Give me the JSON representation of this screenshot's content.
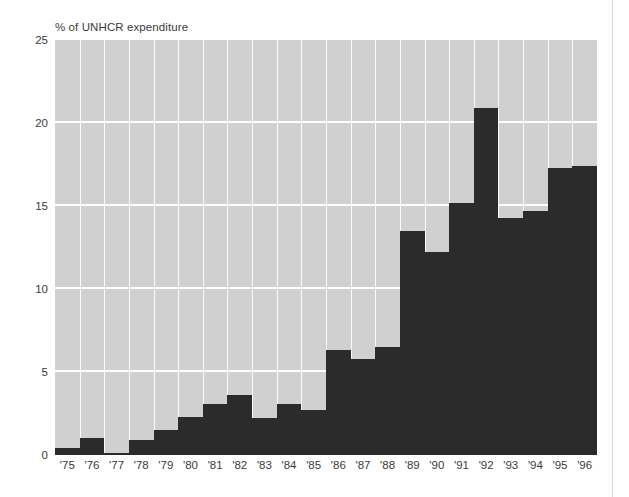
{
  "figure": {
    "title": "% of UNHCR expenditure",
    "background_color": "#ffffff",
    "plot_background_color": "#d0d0d0",
    "bar_color": "#2b2b2b",
    "grid_color": "#ffffff",
    "text_color": "#3b3b3b"
  },
  "axes": {
    "y_ticks": [
      "25",
      "20",
      "15",
      "10",
      "5",
      "0"
    ],
    "y_tick_values": [
      25,
      20,
      15,
      10,
      5,
      0
    ],
    "x_ticks": [
      "'75",
      "'76",
      "'77",
      "'78",
      "'79",
      "'80",
      "'81",
      "'82",
      "'83",
      "'84",
      "'85",
      "'86",
      "'87",
      "'88",
      "'89",
      "'90",
      "'91",
      "'92",
      "'93",
      "'94",
      "'95",
      "'96"
    ]
  },
  "chart_data": {
    "type": "bar",
    "title": "% of UNHCR expenditure",
    "xlabel": "",
    "ylabel": "% of UNHCR expenditure",
    "ylim": [
      0,
      25
    ],
    "yticks": [
      0,
      5,
      10,
      15,
      20,
      25
    ],
    "grid": true,
    "legend": false,
    "categories": [
      "'75",
      "'76",
      "'77",
      "'78",
      "'79",
      "'80",
      "'81",
      "'82",
      "'83",
      "'84",
      "'85",
      "'86",
      "'87",
      "'88",
      "'89",
      "'90",
      "'91",
      "'92",
      "'93",
      "'94",
      "'95",
      "'96"
    ],
    "values": [
      0.4,
      1.0,
      0.1,
      0.9,
      1.5,
      2.3,
      3.1,
      3.6,
      2.2,
      3.1,
      2.7,
      6.3,
      5.8,
      6.5,
      13.5,
      12.2,
      15.2,
      20.9,
      14.3,
      14.7,
      17.3,
      17.4
    ],
    "series": [
      {
        "name": "% of UNHCR expenditure",
        "values": [
          0.4,
          1.0,
          0.1,
          0.9,
          1.5,
          2.3,
          3.1,
          3.6,
          2.2,
          3.1,
          2.7,
          6.3,
          5.8,
          6.5,
          13.5,
          12.2,
          15.2,
          20.9,
          14.3,
          14.7,
          17.3,
          17.4
        ]
      }
    ]
  }
}
